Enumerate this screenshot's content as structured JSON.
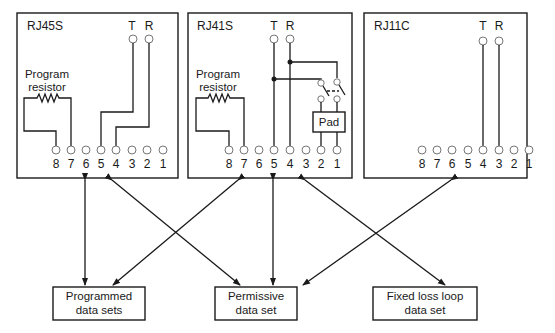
{
  "jacks": [
    {
      "name": "RJ45S",
      "pin_labels": [
        "8",
        "7",
        "6",
        "5",
        "4",
        "3",
        "2",
        "1"
      ],
      "tip_label": "T",
      "ring_label": "R",
      "resistor_label_line1": "Program",
      "resistor_label_line2": "resistor",
      "wiring": {
        "T": "5",
        "R": "4",
        "resistor": [
          "8",
          "7"
        ]
      }
    },
    {
      "name": "RJ41S",
      "pin_labels": [
        "8",
        "7",
        "6",
        "5",
        "4",
        "3",
        "2",
        "1"
      ],
      "tip_label": "T",
      "ring_label": "R",
      "resistor_label_line1": "Program",
      "resistor_label_line2": "resistor",
      "pad_label": "Pad",
      "wiring": {
        "T": "5",
        "R": "4",
        "resistor": [
          "8",
          "7"
        ],
        "pad": [
          "2",
          "1"
        ]
      }
    },
    {
      "name": "RJ11C",
      "pin_labels": [
        "8",
        "7",
        "6",
        "5",
        "4",
        "3",
        "2",
        "1"
      ],
      "tip_label": "T",
      "ring_label": "R",
      "wiring": {
        "T": "4",
        "R": "3"
      }
    }
  ],
  "data_sets": [
    {
      "line1": "Programmed",
      "line2": "data sets"
    },
    {
      "line1": "Permissive",
      "line2": "data set"
    },
    {
      "line1": "Fixed loss loop",
      "line2": "data set"
    }
  ],
  "connections": [
    {
      "from": "RJ45S",
      "to": "Programmed data sets"
    },
    {
      "from": "RJ45S",
      "to": "Permissive data set"
    },
    {
      "from": "RJ41S",
      "to": "Programmed data sets"
    },
    {
      "from": "RJ41S",
      "to": "Permissive data set"
    },
    {
      "from": "RJ41S",
      "to": "Fixed loss loop data set"
    },
    {
      "from": "RJ11C",
      "to": "Permissive data set"
    }
  ]
}
